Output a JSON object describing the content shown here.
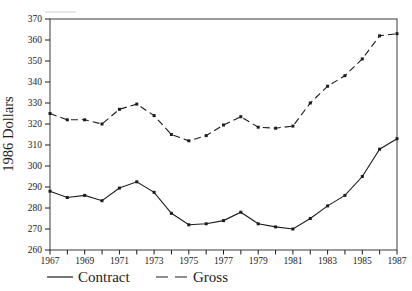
{
  "figure": {
    "background": "#ffffff",
    "ink_color": "#1c1c1c",
    "frame_color": "#3a3a3a"
  },
  "chart_data": {
    "type": "line",
    "title": "",
    "xlabel": "",
    "ylabel": "1986 Dollars",
    "x": [
      1967,
      1968,
      1969,
      1970,
      1971,
      1972,
      1973,
      1974,
      1975,
      1976,
      1977,
      1978,
      1979,
      1980,
      1981,
      1982,
      1983,
      1984,
      1985,
      1986,
      1987
    ],
    "x_tick_labels": [
      "1967",
      "1969",
      "1971",
      "1973",
      "1975",
      "1977",
      "1979",
      "1981",
      "1983",
      "1985",
      "1987"
    ],
    "yticks": [
      260,
      270,
      280,
      290,
      300,
      310,
      320,
      330,
      340,
      350,
      360,
      370
    ],
    "ylim": [
      260,
      370
    ],
    "grid": false,
    "marker": "square",
    "legend_position": "bottom-left",
    "series": [
      {
        "name": "Contract",
        "style": "solid",
        "values": [
          288,
          285,
          286,
          283.5,
          289.5,
          292.5,
          287.5,
          277.5,
          272,
          272.5,
          274,
          278,
          272.5,
          271,
          270,
          275,
          281,
          286,
          295,
          308,
          313
        ]
      },
      {
        "name": "Gross",
        "style": "dashed",
        "values": [
          325,
          322,
          322,
          320,
          327,
          329.5,
          324,
          315,
          312,
          314.5,
          319.5,
          323.5,
          318.5,
          318,
          319,
          330,
          338,
          343,
          351,
          362,
          363
        ]
      }
    ]
  }
}
